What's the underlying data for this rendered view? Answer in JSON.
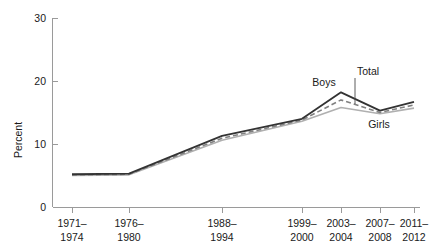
{
  "chart_data": {
    "type": "line",
    "title": "",
    "xlabel": "",
    "ylabel": "Percent",
    "ylim": [
      0,
      30
    ],
    "yticks": [
      0,
      10,
      20,
      30
    ],
    "ytick_labels": [
      "0",
      "10",
      "20",
      "30"
    ],
    "grid": false,
    "legend_position": "inline-annotations",
    "categories": [
      "1971–\n1974",
      "1976–\n1980",
      "1988–\n1994",
      "1999–\n2000",
      "2003–\n2004",
      "2007–\n2008",
      "2011–\n2012"
    ],
    "category_lines": [
      [
        "1971–",
        "1974"
      ],
      [
        "1976–",
        "1980"
      ],
      [
        "1988–",
        "1994"
      ],
      [
        "1999–",
        "2000"
      ],
      [
        "2003–",
        "2004"
      ],
      [
        "2007–",
        "2008"
      ],
      [
        "2011–",
        "2012"
      ]
    ],
    "series": [
      {
        "name": "Boys",
        "color": "#333333",
        "style": "solid",
        "values": [
          5.2,
          5.3,
          11.3,
          14.0,
          18.2,
          15.3,
          16.7
        ]
      },
      {
        "name": "Total",
        "color": "#808080",
        "style": "dashed",
        "values": [
          5.1,
          5.2,
          10.9,
          13.8,
          17.0,
          15.0,
          16.2
        ]
      },
      {
        "name": "Girls",
        "color": "#b0b0b0",
        "style": "solid",
        "values": [
          5.0,
          5.1,
          10.6,
          13.6,
          15.8,
          14.8,
          15.7
        ]
      }
    ]
  },
  "labels": {
    "boys": "Boys",
    "total": "Total",
    "girls": "Girls",
    "ylabel": "Percent"
  },
  "yticks": {
    "t0": "0",
    "t10": "10",
    "t20": "20",
    "t30": "30"
  },
  "xticks": {
    "c0_top": "1971–",
    "c0_bot": "1974",
    "c1_top": "1976–",
    "c1_bot": "1980",
    "c2_top": "1988–",
    "c2_bot": "1994",
    "c3_top": "1999–",
    "c3_bot": "2000",
    "c4_top": "2003–",
    "c4_bot": "2004",
    "c5_top": "2007–",
    "c5_bot": "2008",
    "c6_top": "2011–",
    "c6_bot": "2012"
  }
}
